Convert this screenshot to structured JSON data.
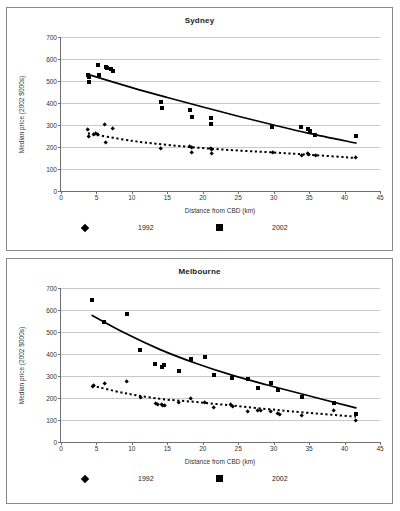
{
  "page": {
    "top_caption": "",
    "background": "#ffffff",
    "series_color": "#000000",
    "grid_color": "#c9c9c9",
    "axis_color": "#6f6f6f"
  },
  "chart_data": [
    {
      "type": "scatter",
      "title": "Sydney",
      "xlabel": "Distance from CBD (km)",
      "ylabel": "Median price (2002 $000s)",
      "xlim": [
        0,
        45
      ],
      "ylim": [
        0,
        700
      ],
      "xticks": [
        0,
        5,
        10,
        15,
        20,
        25,
        30,
        35,
        40,
        45
      ],
      "yticks": [
        0,
        100,
        200,
        300,
        400,
        500,
        600,
        700
      ],
      "grid": "horizontal",
      "legend_position": "below-axis",
      "legend": [
        {
          "label": "1992",
          "marker": "diamond"
        },
        {
          "label": "2002",
          "marker": "square"
        }
      ],
      "series": [
        {
          "name": "1992",
          "marker": "diamond",
          "trend": "dotted",
          "points": [
            [
              3.8,
              279
            ],
            [
              3.9,
              247
            ],
            [
              4.6,
              257
            ],
            [
              4.9,
              262
            ],
            [
              5.2,
              254
            ],
            [
              6.2,
              302
            ],
            [
              6.3,
              218
            ],
            [
              7.3,
              283
            ],
            [
              14.1,
              193
            ],
            [
              18.2,
              201
            ],
            [
              18.4,
              197
            ],
            [
              18.5,
              173
            ],
            [
              21.1,
              192
            ],
            [
              21.2,
              186
            ],
            [
              21.3,
              169
            ],
            [
              29.8,
              176
            ],
            [
              33.9,
              160
            ],
            [
              34.8,
              170
            ],
            [
              34.9,
              163
            ],
            [
              35.9,
              160
            ],
            [
              41.6,
              150
            ]
          ],
          "trend_points": [
            [
              3.8,
              262
            ],
            [
              10,
              228
            ],
            [
              15,
              210
            ],
            [
              20,
              195
            ],
            [
              25,
              184
            ],
            [
              30,
              175
            ],
            [
              35,
              165
            ],
            [
              41.6,
              150
            ]
          ]
        },
        {
          "name": "2002",
          "marker": "square",
          "trend": "solid",
          "points": [
            [
              3.8,
              527
            ],
            [
              3.9,
              516
            ],
            [
              4.0,
              495
            ],
            [
              5.2,
              573
            ],
            [
              5.3,
              526
            ],
            [
              6.3,
              563
            ],
            [
              6.5,
              558
            ],
            [
              7.1,
              553
            ],
            [
              7.4,
              545
            ],
            [
              14.1,
              405
            ],
            [
              14.2,
              378
            ],
            [
              18.2,
              370
            ],
            [
              18.5,
              336
            ],
            [
              21.1,
              333
            ],
            [
              21.2,
              305
            ],
            [
              29.8,
              291
            ],
            [
              33.9,
              289
            ],
            [
              34.8,
              281
            ],
            [
              35.1,
              272
            ],
            [
              35.9,
              255
            ],
            [
              41.6,
              249
            ]
          ],
          "trend_points": [
            [
              3.8,
              530
            ],
            [
              10,
              470
            ],
            [
              15,
              425
            ],
            [
              20,
              382
            ],
            [
              25,
              340
            ],
            [
              30,
              300
            ],
            [
              35,
              262
            ],
            [
              41.6,
              218
            ]
          ]
        }
      ]
    },
    {
      "type": "scatter",
      "title": "Melbourne",
      "xlabel": "Distance from CBD (km)",
      "ylabel": "Median price (2002 $000s)",
      "xlim": [
        0,
        45
      ],
      "ylim": [
        0,
        700
      ],
      "xticks": [
        0,
        5,
        10,
        15,
        20,
        25,
        30,
        35,
        40,
        45
      ],
      "yticks": [
        0,
        100,
        200,
        300,
        400,
        500,
        600,
        700
      ],
      "grid": "horizontal",
      "legend_position": "below-axis",
      "legend": [
        {
          "label": "1992",
          "marker": "diamond"
        },
        {
          "label": "2002",
          "marker": "square"
        }
      ],
      "series": [
        {
          "name": "1992",
          "marker": "diamond",
          "trend": "dotted",
          "points": [
            [
              4.4,
              252
            ],
            [
              4.6,
              258
            ],
            [
              6.1,
              264
            ],
            [
              9.3,
              274
            ],
            [
              11.2,
              202
            ],
            [
              13.3,
              174
            ],
            [
              13.6,
              170
            ],
            [
              14.2,
              169
            ],
            [
              14.4,
              165
            ],
            [
              14.6,
              164
            ],
            [
              16.6,
              180
            ],
            [
              18.3,
              198
            ],
            [
              20.3,
              178
            ],
            [
              21.6,
              156
            ],
            [
              24.0,
              170
            ],
            [
              24.2,
              160
            ],
            [
              26.4,
              140
            ],
            [
              27.8,
              144
            ],
            [
              28.1,
              141
            ],
            [
              29.6,
              138
            ],
            [
              30.6,
              127
            ],
            [
              30.8,
              124
            ],
            [
              34.0,
              120
            ],
            [
              38.5,
              141
            ],
            [
              41.6,
              99
            ]
          ],
          "trend_points": [
            [
              4.4,
              256
            ],
            [
              9,
              222
            ],
            [
              14,
              196
            ],
            [
              19,
              182
            ],
            [
              24,
              166
            ],
            [
              29,
              150
            ],
            [
              34,
              135
            ],
            [
              41.6,
              115
            ]
          ]
        },
        {
          "name": "2002",
          "marker": "square",
          "trend": "solid",
          "points": [
            [
              4.4,
              645
            ],
            [
              6.1,
              545
            ],
            [
              9.3,
              580
            ],
            [
              11.2,
              420
            ],
            [
              13.3,
              356
            ],
            [
              14.2,
              341
            ],
            [
              14.6,
              350
            ],
            [
              16.6,
              321
            ],
            [
              18.3,
              376
            ],
            [
              20.3,
              387
            ],
            [
              21.6,
              303
            ],
            [
              24.1,
              293
            ],
            [
              26.4,
              285
            ],
            [
              27.8,
              247
            ],
            [
              29.6,
              268
            ],
            [
              30.6,
              238
            ],
            [
              34.0,
              205
            ],
            [
              38.5,
              176
            ],
            [
              41.6,
              128
            ]
          ],
          "trend_points": [
            [
              4.4,
              575
            ],
            [
              9,
              495
            ],
            [
              14,
              420
            ],
            [
              19,
              358
            ],
            [
              24,
              305
            ],
            [
              29,
              260
            ],
            [
              34,
              218
            ],
            [
              41.6,
              155
            ]
          ]
        }
      ]
    }
  ]
}
